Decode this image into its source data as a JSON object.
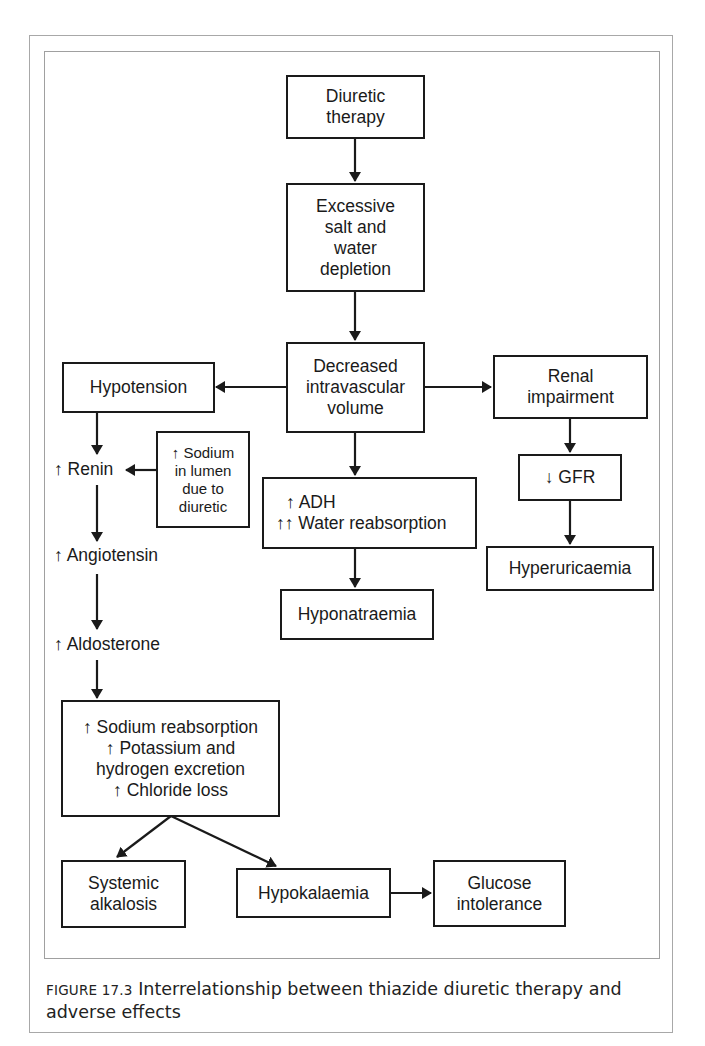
{
  "figure": {
    "caption_label": "FIGURE 17.3",
    "caption_text": " Interrelationship between thiazide diuretic therapy and adverse effects"
  },
  "nodes": {
    "diuretic_therapy": [
      "Diuretic",
      "therapy"
    ],
    "depletion": [
      "Excessive",
      "salt and",
      "water",
      "depletion"
    ],
    "decreased_volume": [
      "Decreased",
      "intravascular",
      "volume"
    ],
    "hypotension": [
      "Hypotension"
    ],
    "renal_impairment": [
      "Renal",
      "impairment"
    ],
    "sodium_lumen": [
      "↑ Sodium",
      "in lumen",
      "due to",
      "diuretic"
    ],
    "renin": "↑ Renin",
    "adh": [
      "↑ ADH",
      "↑↑ Water reabsorption"
    ],
    "gfr": [
      "↓ GFR"
    ],
    "angiotensin": "↑ Angiotensin",
    "hyponatraemia": [
      "Hyponatraemia"
    ],
    "hyperuricaemia": [
      "Hyperuricaemia"
    ],
    "aldosterone": "↑ Aldosterone",
    "sodium_reabsorption": [
      "↑ Sodium reabsorption",
      "↑ Potassium and",
      "hydrogen excretion",
      "↑ Chloride loss"
    ],
    "systemic_alkalosis": [
      "Systemic",
      "alkalosis"
    ],
    "hypokalaemia": [
      "Hypokalaemia"
    ],
    "glucose_intolerance": [
      "Glucose",
      "intolerance"
    ]
  },
  "edges": [
    {
      "from": "diuretic_therapy",
      "to": "depletion"
    },
    {
      "from": "depletion",
      "to": "decreased_volume"
    },
    {
      "from": "decreased_volume",
      "to": "hypotension"
    },
    {
      "from": "decreased_volume",
      "to": "renal_impairment"
    },
    {
      "from": "decreased_volume",
      "to": "adh"
    },
    {
      "from": "hypotension",
      "to": "renin"
    },
    {
      "from": "sodium_lumen",
      "to": "renin"
    },
    {
      "from": "renin",
      "to": "angiotensin"
    },
    {
      "from": "angiotensin",
      "to": "aldosterone"
    },
    {
      "from": "aldosterone",
      "to": "sodium_reabsorption"
    },
    {
      "from": "sodium_reabsorption",
      "to": "systemic_alkalosis"
    },
    {
      "from": "sodium_reabsorption",
      "to": "hypokalaemia"
    },
    {
      "from": "hypokalaemia",
      "to": "glucose_intolerance"
    },
    {
      "from": "adh",
      "to": "hyponatraemia"
    },
    {
      "from": "renal_impairment",
      "to": "gfr"
    },
    {
      "from": "gfr",
      "to": "hyperuricaemia"
    }
  ],
  "colors": {
    "stroke": "#1a1a1a",
    "frame": "#a8a8a8",
    "background": "#ffffff"
  }
}
